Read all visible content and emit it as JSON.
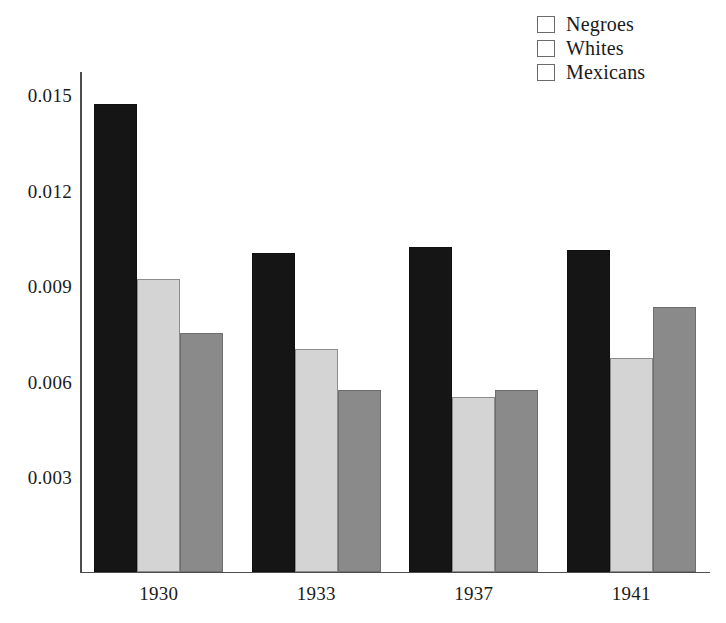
{
  "chart_data": {
    "type": "bar",
    "title": "",
    "xlabel": "",
    "ylabel": "",
    "categories": [
      "1930",
      "1933",
      "1937",
      "1941"
    ],
    "series": [
      {
        "name": "Negroes",
        "color": "#151515",
        "values": [
          0.0147,
          0.01,
          0.0102,
          0.0101
        ]
      },
      {
        "name": "Whites",
        "color": "#d4d4d4",
        "values": [
          0.0092,
          0.007,
          0.0055,
          0.0067
        ]
      },
      {
        "name": "Mexicans",
        "color": "#8a8a8a",
        "values": [
          0.0075,
          0.0057,
          0.0057,
          0.0083
        ]
      }
    ],
    "yticks": [
      0.015,
      0.012,
      0.009,
      0.006,
      0.003
    ],
    "ytick_labels": [
      "0.015",
      "0.012",
      "0.009",
      "0.006",
      "0.003"
    ],
    "ylim": [
      0,
      0.01575
    ],
    "grid": false,
    "legend_position": "top-right",
    "axis_color": "#4d4d4d",
    "background": "#ffffff"
  },
  "legend": {
    "items": [
      {
        "label": "Negroes"
      },
      {
        "label": "Whites"
      },
      {
        "label": "Mexicans"
      }
    ]
  }
}
